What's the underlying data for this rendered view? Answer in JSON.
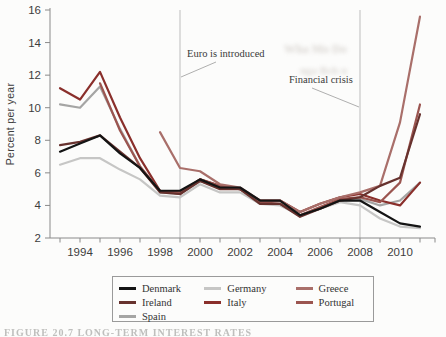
{
  "figure": {
    "ylabel": "Percent per year",
    "caption_faint": "FIGURE 20.7   LONG-TERM INTEREST RATES"
  },
  "annotations": [
    {
      "text": "Euro is introduced",
      "year": 1999
    },
    {
      "text": "Financial crisis",
      "year": 2008
    }
  ],
  "colors": {
    "Denmark": "#141414",
    "Germany": "#c6c6c5",
    "Greece": "#a96f6a",
    "Ireland": "#67322e",
    "Italy": "#8a2f2b",
    "Portugal": "#9b5550",
    "Spain": "#a5a5a4"
  },
  "legend": {
    "columns": [
      [
        "Denmark",
        "Ireland",
        "Spain"
      ],
      [
        "Germany",
        "Italy"
      ],
      [
        "Greece",
        "Portugal"
      ]
    ]
  },
  "chart_data": {
    "type": "line",
    "title": "",
    "xlabel": "",
    "ylabel": "Percent per year",
    "ylim": [
      2,
      16
    ],
    "xlim": [
      1993,
      2011
    ],
    "yticks": [
      2,
      4,
      6,
      8,
      10,
      12,
      14,
      16
    ],
    "xticks": [
      1994,
      1996,
      1998,
      2000,
      2002,
      2004,
      2006,
      2008,
      2010
    ],
    "grid": false,
    "legend_position": "bottom",
    "vlines": [
      {
        "x": 1999,
        "label": "Euro is introduced"
      },
      {
        "x": 2008,
        "label": "Financial crisis"
      }
    ],
    "x": [
      1993,
      1994,
      1995,
      1996,
      1997,
      1998,
      1999,
      2000,
      2001,
      2002,
      2003,
      2004,
      2005,
      2006,
      2007,
      2008,
      2009,
      2010,
      2011
    ],
    "series": [
      {
        "name": "Spain",
        "values": [
          10.2,
          10.0,
          11.3,
          8.7,
          6.4,
          4.8,
          4.7,
          5.5,
          5.1,
          5.0,
          4.1,
          4.1,
          3.4,
          3.8,
          4.3,
          4.4,
          4.0,
          4.3,
          5.4
        ]
      },
      {
        "name": "Germany",
        "values": [
          6.5,
          6.9,
          6.9,
          6.2,
          5.6,
          4.6,
          4.5,
          5.3,
          4.8,
          4.8,
          4.1,
          4.0,
          3.4,
          3.8,
          4.2,
          4.0,
          3.2,
          2.7,
          2.6
        ]
      },
      {
        "name": "Italy",
        "values": [
          11.2,
          10.5,
          12.2,
          9.4,
          6.9,
          4.9,
          4.7,
          5.6,
          5.2,
          5.0,
          4.3,
          4.3,
          3.6,
          4.1,
          4.5,
          4.7,
          4.3,
          4.0,
          5.4
        ]
      },
      {
        "name": "Portugal",
        "values": [
          null,
          null,
          11.5,
          8.6,
          6.4,
          4.9,
          4.8,
          5.6,
          5.2,
          5.0,
          4.2,
          4.1,
          3.4,
          3.9,
          4.4,
          4.5,
          4.2,
          5.4,
          10.2
        ]
      },
      {
        "name": "Greece",
        "values": [
          null,
          null,
          null,
          null,
          null,
          8.5,
          6.3,
          6.1,
          5.3,
          5.1,
          4.3,
          4.3,
          3.6,
          4.1,
          4.5,
          4.8,
          5.2,
          9.1,
          15.6
        ]
      },
      {
        "name": "Ireland",
        "values": [
          7.7,
          7.9,
          8.3,
          7.3,
          6.3,
          4.8,
          4.7,
          5.5,
          5.0,
          5.0,
          4.1,
          4.1,
          3.3,
          3.8,
          4.3,
          4.5,
          5.2,
          5.7,
          9.6
        ]
      },
      {
        "name": "Denmark",
        "values": [
          7.3,
          7.8,
          8.3,
          7.2,
          6.3,
          4.9,
          4.9,
          5.6,
          5.1,
          5.1,
          4.3,
          4.3,
          3.4,
          3.8,
          4.3,
          4.3,
          3.6,
          2.9,
          2.7
        ]
      }
    ]
  }
}
